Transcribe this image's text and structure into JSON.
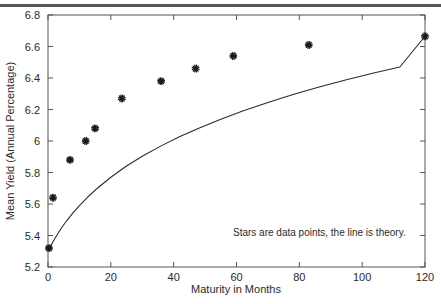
{
  "chart_data": {
    "type": "scatter",
    "title": "",
    "xlabel": "Maturity in Months",
    "ylabel": "Mean Yield (Annual Percentage)",
    "xlim": [
      0,
      120
    ],
    "ylim": [
      5.2,
      6.8
    ],
    "xticks": [
      0,
      20,
      40,
      60,
      80,
      100,
      120
    ],
    "xtick_labels": [
      "0",
      "20",
      "40",
      "60",
      "80",
      "100",
      "120"
    ],
    "yticks": [
      5.2,
      5.4,
      5.6,
      5.8,
      6.0,
      6.2,
      6.4,
      6.6,
      6.8
    ],
    "ytick_labels": [
      "5.2",
      "5.4",
      "5.6",
      "5.8",
      "6",
      "6.2",
      "6.4",
      "6.6",
      "6.8"
    ],
    "grid": false,
    "legend_position": "none",
    "annotations": [
      {
        "text": "Stars are data points, the line is theory.",
        "x": 59,
        "y": 5.42
      }
    ],
    "series": [
      {
        "name": "data points",
        "type": "scatter",
        "marker": "star",
        "color": "#1a1a1a",
        "x": [
          0.3,
          1.6,
          7.0,
          12.0,
          15.0,
          23.5,
          36.0,
          47.0,
          59.0,
          83.0,
          120.0
        ],
        "y": [
          5.32,
          5.64,
          5.88,
          6.0,
          6.08,
          6.27,
          6.38,
          6.46,
          6.54,
          6.61,
          6.665
        ]
      },
      {
        "name": "theory",
        "type": "line",
        "color": "#2b2b2b",
        "x": [
          0.3,
          2,
          4,
          6,
          8,
          10,
          13,
          16,
          20,
          25,
          30,
          36,
          42,
          48,
          55,
          62,
          70,
          78,
          86,
          95,
          104,
          112,
          120
        ],
        "y": [
          5.315,
          5.375,
          5.44,
          5.495,
          5.545,
          5.59,
          5.651,
          5.705,
          5.77,
          5.841,
          5.903,
          5.969,
          6.028,
          6.081,
          6.138,
          6.19,
          6.245,
          6.295,
          6.341,
          6.389,
          6.433,
          6.47,
          6.665
        ]
      }
    ]
  },
  "figure": {
    "marker_glyph": "✳"
  }
}
